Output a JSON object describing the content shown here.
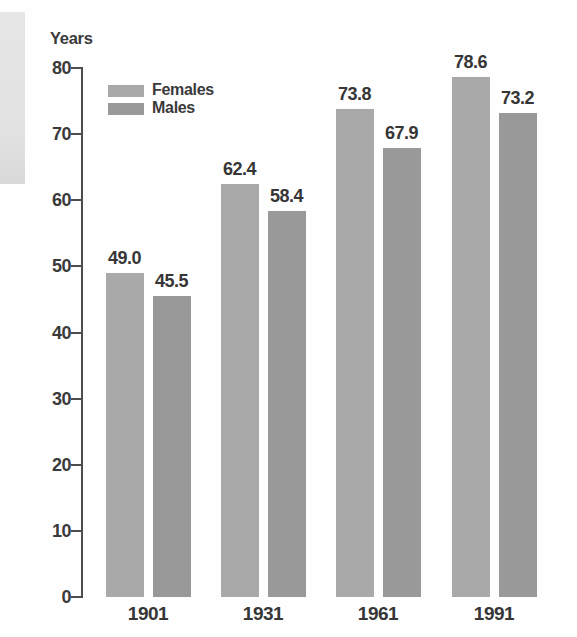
{
  "chart_data": {
    "type": "bar",
    "title": "",
    "ylabel": "Years",
    "xlabel": "",
    "categories": [
      "1901",
      "1931",
      "1961",
      "1991"
    ],
    "series": [
      {
        "name": "Females",
        "color": "#a9a9a9",
        "values": [
          49.0,
          62.4,
          73.8,
          78.6
        ]
      },
      {
        "name": "Males",
        "color": "#999999",
        "values": [
          45.5,
          58.4,
          67.9,
          73.2
        ]
      }
    ],
    "value_labels": {
      "Females": [
        "49.0",
        "62.4",
        "73.8",
        "78.6"
      ],
      "Males": [
        "45.5",
        "58.4",
        "67.9",
        "73.2"
      ]
    },
    "ylim": [
      0,
      80
    ],
    "yticks": [
      0,
      10,
      20,
      30,
      40,
      50,
      60,
      70,
      80
    ],
    "grid": false,
    "legend_position": "top-left"
  },
  "colors": {
    "axis": "#4d4d4d",
    "text": "#3a3a3a",
    "page_edge_strip": "#e3e3e3"
  }
}
